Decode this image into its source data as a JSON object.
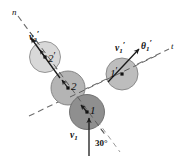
{
  "figure": {
    "canvas": {
      "width": 184,
      "height": 161,
      "background": "#ffffff"
    },
    "axes": [
      {
        "name": "n-axis",
        "label": "n",
        "label_x": 12,
        "label_y": 8,
        "style": "dashed",
        "x1": 18,
        "y1": 16,
        "x2": 106,
        "y2": 136
      },
      {
        "name": "t-axis",
        "label": "t",
        "label_x": 171,
        "label_y": 42,
        "style": "dashed",
        "x1": 29,
        "y1": 116,
        "x2": 169,
        "y2": 49
      }
    ],
    "balls": [
      {
        "id": "2p",
        "label": "2",
        "prime": "′",
        "cx": 45,
        "cy": 57,
        "r": 15.5,
        "fill": "#d8d8d8",
        "stroke": "#8c8c8c",
        "label_x": 48,
        "label_y": 51
      },
      {
        "id": "2",
        "label": "2",
        "prime": "",
        "cx": 68,
        "cy": 88,
        "r": 17.0,
        "fill": "#b4b4b4",
        "stroke": "#7d7d7d",
        "label_x": 71,
        "label_y": 81
      },
      {
        "id": "1",
        "label": "1",
        "prime": "",
        "cx": 87,
        "cy": 112,
        "r": 17.5,
        "fill": "#8f8f8f",
        "stroke": "#6a6a6a",
        "label_x": 90,
        "label_y": 105
      },
      {
        "id": "1p",
        "label": "1",
        "prime": "′",
        "cx": 122,
        "cy": 74,
        "r": 16.0,
        "fill": "#bdbdbd",
        "stroke": "#838383",
        "label_x": 110,
        "label_y": 67
      }
    ],
    "vectors": [
      {
        "name": "v2-prime-vector",
        "label": "v",
        "sub": "2",
        "prime": "′",
        "label_x": 29,
        "label_y": 30,
        "tail_x": 60,
        "tail_y": 78,
        "head_x": 31,
        "head_y": 38
      },
      {
        "name": "v1-prime-vector",
        "label": "v",
        "sub": "1",
        "prime": "′",
        "label_x": 115,
        "label_y": 41,
        "tail_x": 108,
        "tail_y": 82,
        "head_x": 139,
        "head_y": 49
      },
      {
        "name": "v1-vector",
        "label": "v",
        "sub": "1",
        "prime": "",
        "label_x": 70,
        "label_y": 131,
        "tail_x": 89,
        "tail_y": 156,
        "head_x": 89,
        "head_y": 118
      }
    ],
    "angles": [
      {
        "name": "theta1-prime-angle",
        "label": "θ",
        "sub": "1",
        "prime": "′",
        "label_x": 141,
        "label_y": 39
      },
      {
        "name": "impact-angle-30",
        "label": "30°",
        "label_x": 95,
        "label_y": 139
      }
    ],
    "colors": {
      "line": "#6e6e6e",
      "arrow": "#1a1a1a",
      "text": "#111111"
    }
  }
}
